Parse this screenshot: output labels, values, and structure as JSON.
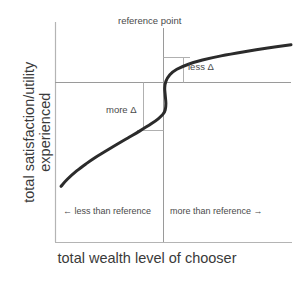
{
  "chart_data": {
    "type": "line",
    "title": "",
    "subtitle": "",
    "xlabel": "total wealth level of chooser",
    "ylabel": "total satisfaction/utility experienced",
    "ylabel_lines": [
      "total satisfaction/utility",
      "experienced"
    ],
    "grid": false,
    "legend": "none",
    "xlim": [
      0,
      100
    ],
    "ylim": [
      0,
      100
    ],
    "axis_ticks": {
      "x": [],
      "y": []
    },
    "series": [
      {
        "name": "value function",
        "color": "#2b2b2b",
        "linewidth": 3,
        "points": [
          {
            "x": 1.3,
            "y": 25.3
          },
          {
            "x": 4.0,
            "y": 28.5
          },
          {
            "x": 8.0,
            "y": 32.3
          },
          {
            "x": 12.0,
            "y": 35.5
          },
          {
            "x": 16.0,
            "y": 38.4
          },
          {
            "x": 20.0,
            "y": 41.0
          },
          {
            "x": 25.0,
            "y": 44.2
          },
          {
            "x": 30.0,
            "y": 47.3
          },
          {
            "x": 35.0,
            "y": 50.4
          },
          {
            "x": 40.0,
            "y": 53.7
          },
          {
            "x": 43.0,
            "y": 56.0
          },
          {
            "x": 45.0,
            "y": 58.0
          },
          {
            "x": 46.0,
            "y": 60.0
          },
          {
            "x": 46.3,
            "y": 63.0
          },
          {
            "x": 46.0,
            "y": 67.0
          },
          {
            "x": 45.8,
            "y": 70.0
          },
          {
            "x": 46.3,
            "y": 73.0
          },
          {
            "x": 48.0,
            "y": 76.0
          },
          {
            "x": 51.0,
            "y": 78.5
          },
          {
            "x": 56.0,
            "y": 80.8
          },
          {
            "x": 62.0,
            "y": 82.7
          },
          {
            "x": 70.0,
            "y": 84.6
          },
          {
            "x": 80.0,
            "y": 86.5
          },
          {
            "x": 90.0,
            "y": 88.2
          },
          {
            "x": 100.0,
            "y": 89.7
          }
        ]
      }
    ],
    "reference_lines": [
      {
        "name": "reference-point-vertical",
        "orientation": "vertical",
        "x": 45.5,
        "color": "#9a9a9a"
      },
      {
        "name": "reference-point-horizontal",
        "orientation": "horizontal",
        "y": 68.5,
        "color": "#9a9a9a"
      }
    ],
    "annotations": [
      {
        "name": "reference-point",
        "text": "reference point",
        "x": 45.5,
        "y": 97
      },
      {
        "name": "less-delta",
        "text": "less Δ",
        "x": 58,
        "y": 76
      },
      {
        "name": "more-delta",
        "text": "more Δ",
        "x": 33,
        "y": 58
      },
      {
        "name": "zone-left",
        "text": "← less than reference",
        "x": 23,
        "y": 20
      },
      {
        "name": "zone-right",
        "text": "more than reference  →",
        "x": 71,
        "y": 20
      }
    ],
    "brackets": [
      {
        "name": "less-delta-bracket",
        "label": "less Δ",
        "from_y": 68.5,
        "to_y": 79.5,
        "at_x": 54.0,
        "note": "smaller utility change for a gain of the same magnitude above the reference point"
      },
      {
        "name": "more-delta-bracket",
        "label": "more Δ",
        "from_y": 68.5,
        "to_y": 48.5,
        "at_x": 38.5,
        "note": "larger utility change for a loss of the same magnitude below the reference point"
      }
    ]
  },
  "colors": {
    "background": "#ffffff",
    "curve": "#2b2b2b",
    "axis": "#b4b4b4",
    "reference_line": "#9a9a9a",
    "bracket_line": "#b0b0b0",
    "text": "#3a3a3a",
    "annotation_text": "#4a4a4a"
  },
  "axes": {
    "x_title": "total wealth level of chooser",
    "y_title_line1": "total satisfaction/utility",
    "y_title_line2": "experienced"
  },
  "labels": {
    "reference_point": "reference point",
    "less_delta": "less Δ",
    "more_delta": "more Δ",
    "zone_left": "← less than reference",
    "zone_right": "more than reference  →"
  }
}
